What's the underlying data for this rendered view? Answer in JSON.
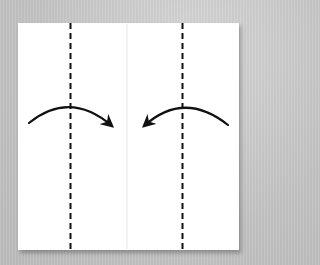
{
  "diagram": {
    "type": "origami-folding-step",
    "colors": {
      "background": "#c9c9c9",
      "paper": "#ffffff",
      "lines": "#111111",
      "center_crease": "#e6e6e6"
    },
    "paper": {
      "x": 18,
      "y": 23,
      "width": 221,
      "height": 227
    },
    "center_crease": {
      "x": 127,
      "y1": 23,
      "y2": 250
    },
    "fold_lines": [
      {
        "id": "left-valley-fold",
        "style": "dashed",
        "x": 70,
        "y1": 23,
        "y2": 250
      },
      {
        "id": "right-valley-fold",
        "style": "dashed",
        "x": 183,
        "y1": 23,
        "y2": 250
      }
    ],
    "arrows": [
      {
        "id": "left-fold-arrow",
        "direction": "right",
        "from": [
          29,
          123
        ],
        "to": [
          113,
          126
        ]
      },
      {
        "id": "right-fold-arrow",
        "direction": "left",
        "from": [
          228,
          125
        ],
        "to": [
          143,
          126
        ]
      }
    ]
  }
}
